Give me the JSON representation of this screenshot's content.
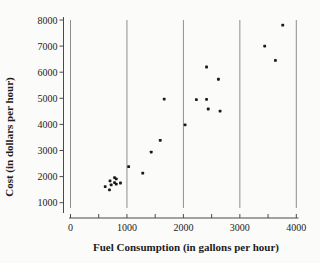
{
  "chart_data": {
    "type": "scatter",
    "title": "",
    "xlabel": "Fuel Consumption (in gallons per hour)",
    "ylabel": "Cost (in dollars per hour)",
    "xlim": [
      0,
      4000
    ],
    "ylim": [
      1000,
      8000
    ],
    "x_ticks": [
      0,
      1000,
      2000,
      3000,
      4000
    ],
    "x_minor_tick_step": 500,
    "y_ticks": [
      1000,
      2000,
      3000,
      4000,
      5000,
      6000,
      7000,
      8000
    ],
    "gridlines": "vertical-only",
    "legend": "none",
    "marker": "small-black-square",
    "points": [
      {
        "x": 3760,
        "y": 7800
      },
      {
        "x": 3440,
        "y": 7000
      },
      {
        "x": 3630,
        "y": 6450
      },
      {
        "x": 2410,
        "y": 6200
      },
      {
        "x": 2620,
        "y": 5730
      },
      {
        "x": 1660,
        "y": 4970
      },
      {
        "x": 2230,
        "y": 4950
      },
      {
        "x": 2410,
        "y": 4960
      },
      {
        "x": 2440,
        "y": 4590
      },
      {
        "x": 2650,
        "y": 4510
      },
      {
        "x": 2030,
        "y": 3980
      },
      {
        "x": 1590,
        "y": 3390
      },
      {
        "x": 1430,
        "y": 2940
      },
      {
        "x": 1030,
        "y": 2380
      },
      {
        "x": 1280,
        "y": 2130
      },
      {
        "x": 885,
        "y": 1755
      },
      {
        "x": 810,
        "y": 1910
      },
      {
        "x": 810,
        "y": 1715
      },
      {
        "x": 780,
        "y": 1960
      },
      {
        "x": 780,
        "y": 1770
      },
      {
        "x": 720,
        "y": 1680
      },
      {
        "x": 700,
        "y": 1840
      },
      {
        "x": 690,
        "y": 1490
      },
      {
        "x": 615,
        "y": 1615
      }
    ],
    "colors": {
      "background": "#fbfbf9",
      "point": "#1a1a1a",
      "grid": "#8e8e8e",
      "axis": "#4a4a4a",
      "text": "#1c1c1c"
    }
  }
}
